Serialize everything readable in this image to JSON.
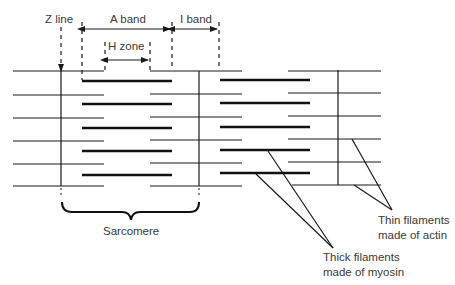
{
  "labels": {
    "z_line": "Z line",
    "a_band": "A band",
    "i_band": "I band",
    "h_zone": "H zone",
    "sarcomere": "Sarcomere",
    "thin_1": "Thin filaments",
    "thin_2": "made of actin",
    "thick_1": "Thick filaments",
    "thick_2": "made of myosin"
  },
  "colors": {
    "line": "#1a1a1a",
    "text": "#3a3a3a"
  }
}
